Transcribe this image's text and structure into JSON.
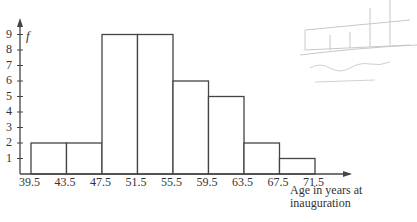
{
  "chart_data": {
    "type": "bar",
    "title": "",
    "xlabel": "Age in years at inauguration",
    "ylabel": "f",
    "bin_edges": [
      39.5,
      43.5,
      47.5,
      51.5,
      55.5,
      59.5,
      63.5,
      67.5,
      71.5
    ],
    "categories": [
      "39.5-43.5",
      "43.5-47.5",
      "47.5-51.5",
      "51.5-55.5",
      "55.5-59.5",
      "59.5-63.5",
      "63.5-67.5",
      "67.5-71.5"
    ],
    "values": [
      2,
      2,
      9,
      9,
      6,
      5,
      2,
      1
    ],
    "yticks": [
      1,
      2,
      3,
      4,
      5,
      6,
      7,
      8,
      9
    ],
    "ylim": [
      0,
      10
    ],
    "grid": false,
    "histogram": true
  },
  "labels": {
    "y_axis": "f",
    "x_axis_line1": "Age in years at",
    "x_axis_line2": "inauguration",
    "xtick_labels": [
      "39.5",
      "43.5",
      "47.5",
      "51.5",
      "55.5",
      "59.5",
      "63.5",
      "67.5",
      "71.5"
    ],
    "ytick_labels": [
      "1",
      "2",
      "3",
      "4",
      "5",
      "6",
      "7",
      "8",
      "9"
    ],
    "caption": "Figure 2.1"
  },
  "colors": {
    "axis": "#444444",
    "bar_edge": "#444444",
    "bar_fill": "#ffffff",
    "pencil": "#bbbbbb"
  }
}
